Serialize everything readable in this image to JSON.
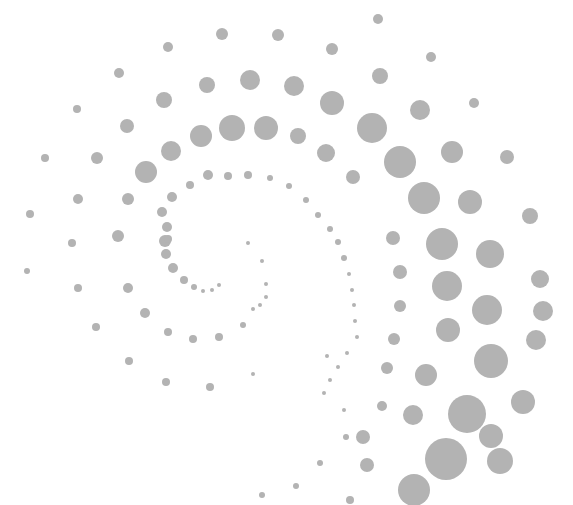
{
  "image": {
    "description": "Decorative spiral made of gray dots on white background",
    "background": "#ffffff",
    "dot_color": "#b3b3b3",
    "width": 573,
    "height": 505
  },
  "dots": [
    [
      378,
      19,
      5
    ],
    [
      222,
      34,
      6
    ],
    [
      278,
      35,
      6
    ],
    [
      168,
      47,
      5
    ],
    [
      332,
      49,
      6
    ],
    [
      431,
      57,
      5
    ],
    [
      119,
      73,
      5
    ],
    [
      207,
      85,
      8
    ],
    [
      250,
      80,
      10
    ],
    [
      294,
      86,
      10
    ],
    [
      380,
      76,
      8
    ],
    [
      474,
      103,
      5
    ],
    [
      77,
      109,
      4
    ],
    [
      164,
      100,
      8
    ],
    [
      332,
      103,
      12
    ],
    [
      420,
      110,
      10
    ],
    [
      127,
      126,
      7
    ],
    [
      201,
      136,
      11
    ],
    [
      232,
      128,
      13
    ],
    [
      266,
      128,
      12
    ],
    [
      298,
      136,
      8
    ],
    [
      372,
      128,
      15
    ],
    [
      452,
      152,
      11
    ],
    [
      507,
      157,
      7
    ],
    [
      45,
      158,
      4
    ],
    [
      97,
      158,
      6
    ],
    [
      171,
      151,
      10
    ],
    [
      326,
      153,
      9
    ],
    [
      400,
      162,
      16
    ],
    [
      146,
      172,
      11
    ],
    [
      353,
      177,
      7
    ],
    [
      424,
      198,
      16
    ],
    [
      470,
      202,
      12
    ],
    [
      530,
      216,
      8
    ],
    [
      30,
      214,
      4
    ],
    [
      78,
      199,
      5
    ],
    [
      128,
      199,
      6
    ],
    [
      172,
      197,
      5
    ],
    [
      190,
      185,
      4
    ],
    [
      208,
      175,
      5
    ],
    [
      228,
      176,
      4
    ],
    [
      248,
      175,
      4
    ],
    [
      270,
      178,
      3
    ],
    [
      289,
      186,
      3
    ],
    [
      306,
      200,
      3
    ],
    [
      318,
      215,
      3
    ],
    [
      330,
      229,
      3
    ],
    [
      338,
      242,
      3
    ],
    [
      344,
      258,
      3
    ],
    [
      349,
      274,
      2
    ],
    [
      352,
      290,
      2
    ],
    [
      354,
      305,
      2
    ],
    [
      355,
      321,
      2
    ],
    [
      357,
      337,
      2
    ],
    [
      347,
      353,
      2
    ],
    [
      338,
      367,
      2
    ],
    [
      330,
      380,
      2
    ],
    [
      324,
      393,
      2
    ],
    [
      162,
      212,
      5
    ],
    [
      167,
      227,
      5
    ],
    [
      165,
      241,
      6
    ],
    [
      166,
      254,
      5
    ],
    [
      173,
      268,
      5
    ],
    [
      184,
      280,
      4
    ],
    [
      194,
      287,
      3
    ],
    [
      203,
      291,
      2
    ],
    [
      212,
      290,
      2
    ],
    [
      219,
      285,
      2
    ],
    [
      248,
      243,
      2
    ],
    [
      262,
      261,
      2
    ],
    [
      266,
      284,
      2
    ],
    [
      260,
      305,
      2
    ],
    [
      442,
      244,
      16
    ],
    [
      490,
      254,
      14
    ],
    [
      393,
      238,
      7
    ],
    [
      118,
      236,
      6
    ],
    [
      72,
      243,
      4
    ],
    [
      168,
      239,
      4
    ],
    [
      400,
      272,
      7
    ],
    [
      447,
      286,
      15
    ],
    [
      540,
      279,
      9
    ],
    [
      27,
      271,
      3
    ],
    [
      78,
      288,
      4
    ],
    [
      128,
      288,
      5
    ],
    [
      400,
      306,
      6
    ],
    [
      487,
      310,
      15
    ],
    [
      543,
      311,
      10
    ],
    [
      96,
      327,
      4
    ],
    [
      145,
      313,
      5
    ],
    [
      448,
      330,
      12
    ],
    [
      394,
      339,
      6
    ],
    [
      491,
      361,
      17
    ],
    [
      536,
      340,
      10
    ],
    [
      168,
      332,
      4
    ],
    [
      193,
      339,
      4
    ],
    [
      219,
      337,
      4
    ],
    [
      243,
      325,
      3
    ],
    [
      253,
      309,
      2
    ],
    [
      266,
      297,
      2
    ],
    [
      426,
      375,
      11
    ],
    [
      387,
      368,
      6
    ],
    [
      129,
      361,
      4
    ],
    [
      467,
      414,
      19
    ],
    [
      523,
      402,
      12
    ],
    [
      166,
      382,
      4
    ],
    [
      210,
      387,
      4
    ],
    [
      253,
      374,
      2
    ],
    [
      327,
      356,
      2
    ],
    [
      382,
      406,
      5
    ],
    [
      413,
      415,
      10
    ],
    [
      491,
      436,
      12
    ],
    [
      344,
      410,
      2
    ],
    [
      446,
      459,
      21
    ],
    [
      500,
      461,
      13
    ],
    [
      346,
      437,
      3
    ],
    [
      363,
      437,
      7
    ],
    [
      320,
      463,
      3
    ],
    [
      367,
      465,
      7
    ],
    [
      414,
      490,
      16
    ],
    [
      296,
      486,
      3
    ],
    [
      262,
      495,
      3
    ],
    [
      350,
      500,
      4
    ]
  ]
}
